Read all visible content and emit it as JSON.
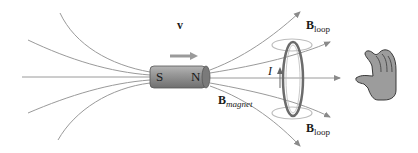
{
  "diagram": {
    "magnet": {
      "south_label": "S",
      "north_label": "N",
      "body_color": "#8a8a8a"
    },
    "velocity": {
      "symbol": "v",
      "direction": "right"
    },
    "current": {
      "symbol": "I",
      "direction": "up"
    },
    "labels": {
      "b_magnet_main": "B",
      "b_magnet_sub": "magnet",
      "b_loop_top_main": "B",
      "b_loop_top_sub": "loop",
      "b_loop_bottom_main": "B",
      "b_loop_bottom_sub": "loop"
    },
    "colors": {
      "field_line": "#9a9a9a",
      "loop": "#6b6b6b",
      "loop_field": "#bdbdbd",
      "hand": "#9c9c9c",
      "text": "#1a1a1a"
    }
  }
}
